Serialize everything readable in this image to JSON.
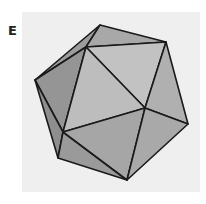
{
  "figure": {
    "label": "E",
    "colors": {
      "background": "#efefef",
      "edge": "#1a1a1a",
      "face_light": "#c4c4c4",
      "face_mid": "#adadad",
      "face_dark": "#959595",
      "face_darker": "#8a8a8a"
    },
    "vertices": {
      "top": [
        100,
        25
      ],
      "upper_right": [
        166,
        42
      ],
      "upper_inner": [
        86,
        47
      ],
      "left": [
        35,
        80
      ],
      "center_right": [
        145,
        108
      ],
      "right": [
        188,
        124
      ],
      "center_left": [
        63,
        132
      ],
      "bottom_left": [
        58,
        158
      ],
      "bottom": [
        127,
        180
      ]
    }
  }
}
